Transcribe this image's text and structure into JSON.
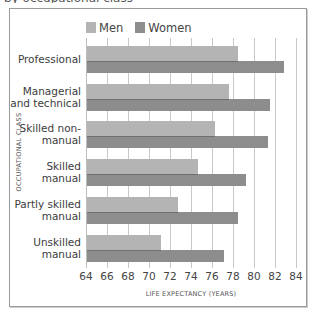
{
  "header": {
    "cropped_title": "by occupational class"
  },
  "chart_data": {
    "type": "bar",
    "orientation": "horizontal",
    "title": "",
    "xlabel": "LIFE EXPECTANCY (YEARS)",
    "ylabel": "OCCUPATIONAL CLASS",
    "xlim": [
      64,
      84
    ],
    "xticks": [
      64,
      66,
      68,
      70,
      72,
      74,
      76,
      78,
      80,
      82,
      84
    ],
    "grid": true,
    "legend_position": "top-left",
    "categories": [
      "Professional",
      "Managerial and technical",
      "Skilled non-manual",
      "Skilled manual",
      "Partly skilled manual",
      "Unskilled manual"
    ],
    "category_lines": [
      [
        "Professional"
      ],
      [
        "Managerial",
        "and technical"
      ],
      [
        "Skilled non-",
        "manual"
      ],
      [
        "Skilled",
        "manual"
      ],
      [
        "Partly skilled",
        "manual"
      ],
      [
        "Unskilled",
        "manual"
      ]
    ],
    "series": [
      {
        "name": "Men",
        "color": "#b4b4b4",
        "values": [
          78.5,
          77.6,
          76.3,
          74.7,
          72.8,
          71.1
        ]
      },
      {
        "name": "Women",
        "color": "#8d8d8d",
        "values": [
          82.9,
          81.5,
          81.3,
          79.2,
          78.5,
          77.1
        ]
      }
    ]
  },
  "legend": {
    "men_label": "Men",
    "women_label": "Women",
    "men_color": "#b4b4b4",
    "women_color": "#8d8d8d"
  }
}
